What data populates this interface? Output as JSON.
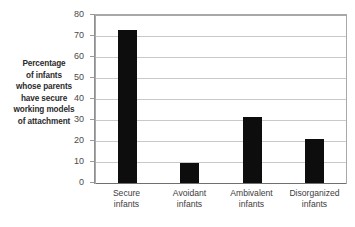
{
  "chart_data": {
    "type": "bar",
    "title": "",
    "subtitle": "",
    "xlabel": "",
    "ylabel": "Percentage of infants whose parents have secure working models of attachment",
    "ylabel_lines": [
      "Percentage",
      "of infants",
      "whose parents",
      "have secure",
      "working models",
      "of attachment"
    ],
    "categories": [
      "Secure infants",
      "Avoidant infants",
      "Ambivalent infants",
      "Disorganized infants"
    ],
    "category_lines": [
      [
        "Secure",
        "infants"
      ],
      [
        "Avoidant",
        "infants"
      ],
      [
        "Ambivalent",
        "infants"
      ],
      [
        "Disorganized",
        "infants"
      ]
    ],
    "values": [
      73,
      9.5,
      31.5,
      21
    ],
    "ylim": [
      0,
      80
    ],
    "ytick_step": 10,
    "yticks": [
      80,
      70,
      60,
      50,
      40,
      30,
      20,
      10,
      0
    ],
    "ytick_labels": [
      "80",
      "70",
      "60",
      "50",
      "40",
      "30",
      "20",
      "10",
      "0"
    ],
    "grid": true,
    "grid_orientation": "horizontal",
    "legend": false,
    "legend_position": "none",
    "bar_color": "#0d0d0d",
    "grid_color": "#c9c9c9",
    "axis_color": "#8d8d8d",
    "background_color": "#ffffff",
    "text_color": "#3d3d3d",
    "label_text_color": "#2b2b2b"
  }
}
